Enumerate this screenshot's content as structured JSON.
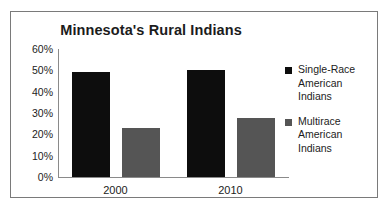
{
  "chart_data": {
    "type": "bar",
    "title": "Minnesota's Rural Indians",
    "xlabel": "",
    "ylabel": "",
    "categories": [
      "2000",
      "2010"
    ],
    "series": [
      {
        "name": "Single-Race American Indians",
        "values": [
          49,
          50
        ],
        "color": "#0d0d0d"
      },
      {
        "name": "Multirace American Indians",
        "values": [
          23,
          27.5
        ],
        "color": "#555555"
      }
    ],
    "ylim": [
      0,
      60
    ],
    "ytick_labels": [
      "60%",
      "50%",
      "40%",
      "30%",
      "20%",
      "10%",
      "0%"
    ],
    "ytick_values": [
      60,
      50,
      40,
      30,
      20,
      10,
      0
    ],
    "grid": false,
    "legend_position": "right"
  },
  "legend": {
    "items": [
      {
        "label_line1": "Single-Race",
        "label_line2": "American",
        "label_line3": "Indians"
      },
      {
        "label_line1": "Multirace",
        "label_line2": "American",
        "label_line3": "Indians"
      }
    ]
  }
}
